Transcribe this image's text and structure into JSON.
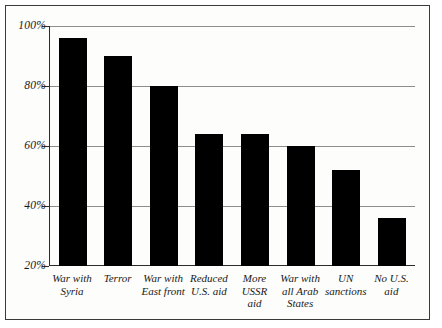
{
  "chart_data": {
    "type": "bar",
    "title": "",
    "subtitle": "",
    "xlabel": "",
    "ylabel": "",
    "ylim": [
      20,
      100
    ],
    "yticks": [
      20,
      40,
      60,
      80,
      100
    ],
    "ytick_labels": [
      "20%",
      "40%",
      "60%",
      "80%",
      "100%"
    ],
    "grid": true,
    "legend": "none",
    "bar_color": "#000000",
    "background_color": "#fdfdfb",
    "frame_color": "#3a3a3a",
    "gridline_color": "#8d8d8d",
    "categories": [
      "War with Syria",
      "Terror",
      "War with East front",
      "Reduced U.S. aid",
      "More USSR aid",
      "War with all Arab States",
      "UN sanctions",
      "No U.S. aid"
    ],
    "category_lines": [
      [
        "War with",
        "Syria"
      ],
      [
        "Terror"
      ],
      [
        "War with",
        "East front"
      ],
      [
        "Reduced",
        "U.S. aid"
      ],
      [
        "More",
        "USSR",
        "aid"
      ],
      [
        "War with",
        "all Arab",
        "States"
      ],
      [
        "UN",
        "sanctions"
      ],
      [
        "No U.S.",
        "aid"
      ]
    ],
    "values": [
      96,
      90,
      80,
      64,
      64,
      60,
      52,
      36
    ],
    "value_labels": [
      "96%",
      "90%",
      "80%",
      "64%",
      "64%",
      "60%",
      "52%",
      "36%"
    ]
  }
}
